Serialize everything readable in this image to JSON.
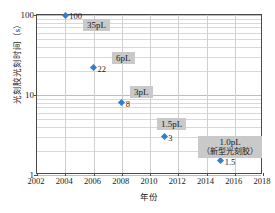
{
  "chart_data": {
    "type": "scatter",
    "title": "",
    "xlabel": "年份",
    "ylabel": "光刻胶光刻时间（s）",
    "xlim": [
      2002,
      2018
    ],
    "ylim": [
      1,
      100
    ],
    "yscale": "log",
    "grid": true,
    "legend": "none",
    "x_ticks": [
      "2002",
      "2004",
      "2006",
      "2008",
      "2010",
      "2012",
      "2014",
      "2016",
      "2018"
    ],
    "y_ticks": [
      "1",
      "10",
      "100"
    ],
    "series": [
      {
        "name": "光刻胶光刻时间",
        "color": "#2f7fd0",
        "marker": "diamond",
        "points": [
          {
            "x": 2004,
            "y": 100,
            "value_label": "100",
            "annotation": "35pL"
          },
          {
            "x": 2006,
            "y": 22,
            "value_label": "22",
            "annotation": "6pL"
          },
          {
            "x": 2008,
            "y": 8,
            "value_label": "8",
            "annotation": "3pL"
          },
          {
            "x": 2011,
            "y": 3,
            "value_label": "3",
            "annotation": "1.5pL"
          },
          {
            "x": 2015,
            "y": 1.5,
            "value_label": "1.5",
            "annotation": "1.0pL",
            "annotation_sub": "（新型光刻胶）"
          }
        ]
      }
    ],
    "annotations": [
      {
        "text": "35pL",
        "sub": "",
        "x_px": 83,
        "y_px": 19
      },
      {
        "text": "6pL",
        "sub": "",
        "x_px": 112,
        "y_px": 52
      },
      {
        "text": "3pL",
        "sub": "",
        "x_px": 130,
        "y_px": 86
      },
      {
        "text": "1.5pL",
        "sub": "",
        "x_px": 157,
        "y_px": 118
      },
      {
        "text": "1.0pL",
        "sub": "（新型光刻胶）",
        "x_px": 198,
        "y_px": 136
      }
    ]
  }
}
